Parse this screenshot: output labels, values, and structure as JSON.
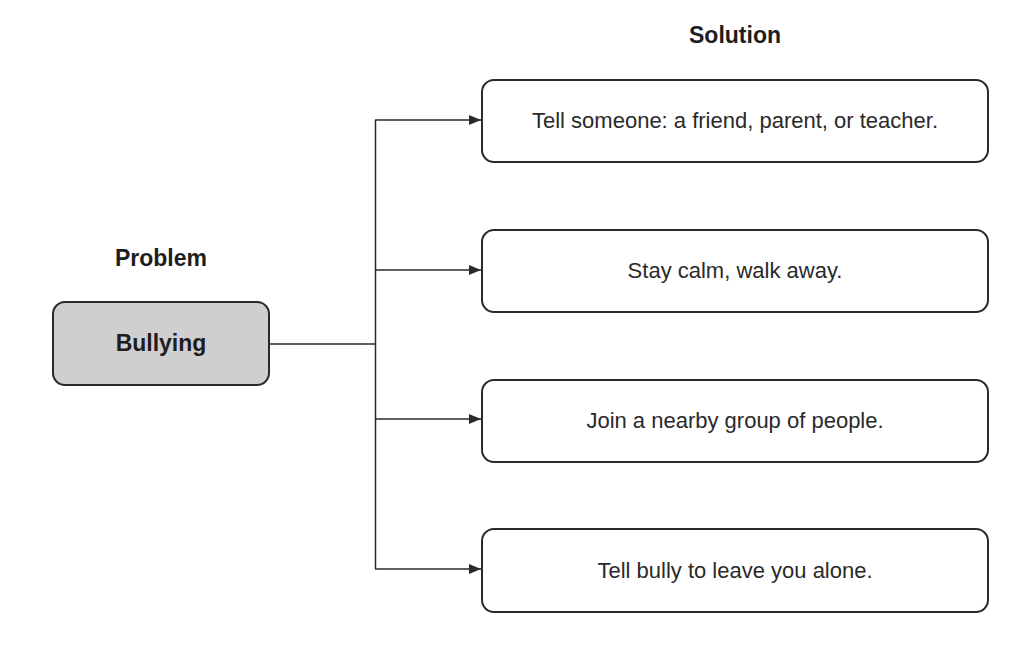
{
  "diagram": {
    "type": "problem-solution",
    "problem": {
      "heading": "Problem",
      "label": "Bullying",
      "fill_color": "#cfcfcf"
    },
    "solution": {
      "heading": "Solution",
      "items": [
        {
          "label": "Tell someone: a friend, parent, or teacher."
        },
        {
          "label": "Stay calm, walk away."
        },
        {
          "label": "Join a nearby group of people."
        },
        {
          "label": "Tell bully to leave you alone."
        }
      ]
    },
    "colors": {
      "stroke": "#2a2a2a",
      "background": "#ffffff"
    }
  }
}
